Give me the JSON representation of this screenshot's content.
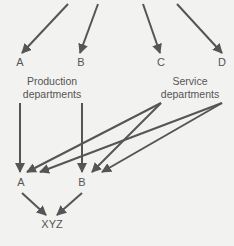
{
  "diagram": {
    "top_nodes": [
      {
        "id": "A",
        "label": "A"
      },
      {
        "id": "B",
        "label": "B"
      },
      {
        "id": "C",
        "label": "C"
      },
      {
        "id": "D",
        "label": "D"
      }
    ],
    "groups": {
      "production": {
        "line1": "Production",
        "line2": "departments"
      },
      "service": {
        "line1": "Service",
        "line2": "departments"
      }
    },
    "bottom_nodes": [
      {
        "id": "A2",
        "label": "A"
      },
      {
        "id": "B2",
        "label": "B"
      }
    ],
    "product": {
      "label": "XYZ"
    },
    "colors": {
      "arrow": "#555555",
      "text": "#555555",
      "background": "#f2f2f0"
    }
  }
}
